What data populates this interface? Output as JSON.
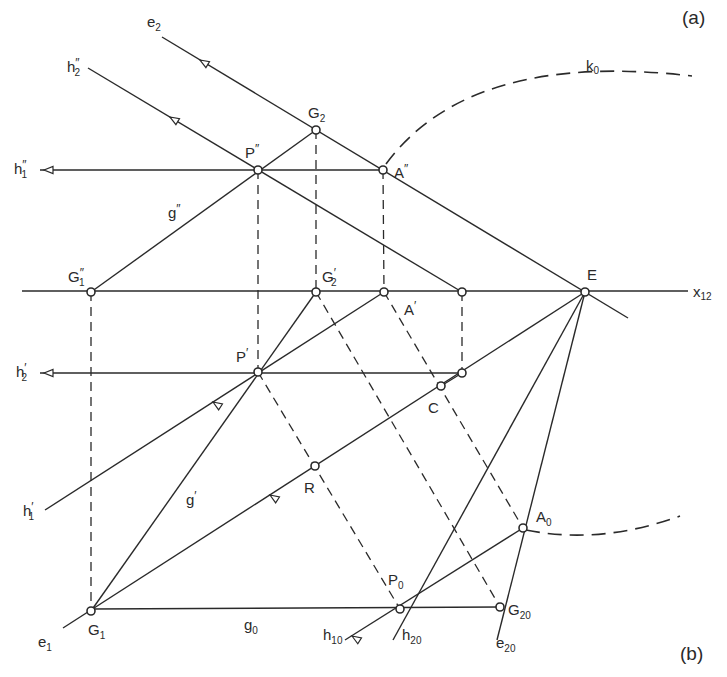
{
  "figure": {
    "panel_labels": {
      "a": "(a)",
      "b": "(b)"
    },
    "axis_label": {
      "base": "x",
      "sub": "12"
    },
    "curve_label": {
      "base": "k",
      "sub": "0"
    }
  },
  "points": [
    {
      "id": "G2",
      "base": "G",
      "sub": "2",
      "prime": "",
      "x": 316,
      "y": 130,
      "lx": 308,
      "ly": 118
    },
    {
      "id": "P''",
      "base": "P",
      "sub": "",
      "prime": "″",
      "x": 258,
      "y": 170,
      "lx": 245,
      "ly": 158
    },
    {
      "id": "A''",
      "base": "A",
      "sub": "",
      "prime": "″",
      "x": 383,
      "y": 170,
      "lx": 394,
      "ly": 178
    },
    {
      "id": "G1''",
      "base": "G",
      "sub": "1",
      "prime": "″",
      "x": 91,
      "y": 292,
      "lx": 68,
      "ly": 282
    },
    {
      "id": "G2'",
      "base": "G",
      "sub": "2",
      "prime": "′",
      "x": 316,
      "y": 292,
      "lx": 322,
      "ly": 282
    },
    {
      "id": "A'",
      "base": "A",
      "sub": "",
      "prime": "′",
      "x": 384,
      "y": 292,
      "lx": 404,
      "ly": 315
    },
    {
      "id": "Q",
      "base": "",
      "sub": "",
      "prime": "",
      "x": 462,
      "y": 292,
      "lx": 0,
      "ly": 0
    },
    {
      "id": "E",
      "base": "E",
      "sub": "",
      "prime": "",
      "x": 585,
      "y": 292,
      "lx": 587,
      "ly": 280
    },
    {
      "id": "P'",
      "base": "P",
      "sub": "",
      "prime": "′",
      "x": 258,
      "y": 372,
      "lx": 236,
      "ly": 362
    },
    {
      "id": "S",
      "base": "",
      "sub": "",
      "prime": "",
      "x": 462,
      "y": 373,
      "lx": 0,
      "ly": 0
    },
    {
      "id": "C",
      "base": "C",
      "sub": "",
      "prime": "",
      "x": 441,
      "y": 386,
      "lx": 428,
      "ly": 413
    },
    {
      "id": "R",
      "base": "R",
      "sub": "",
      "prime": "",
      "x": 315,
      "y": 466,
      "lx": 304,
      "ly": 493
    },
    {
      "id": "A0",
      "base": "A",
      "sub": "0",
      "prime": "",
      "x": 523,
      "y": 528,
      "lx": 536,
      "ly": 522
    },
    {
      "id": "P0",
      "base": "P",
      "sub": "0",
      "prime": "",
      "x": 400,
      "y": 609,
      "lx": 388,
      "ly": 585
    },
    {
      "id": "G20",
      "base": "G",
      "sub": "20",
      "prime": "",
      "x": 500,
      "y": 607,
      "lx": 508,
      "ly": 615
    },
    {
      "id": "G1",
      "base": "G",
      "sub": "1",
      "prime": "",
      "x": 91,
      "y": 611,
      "lx": 88,
      "ly": 635
    }
  ],
  "line_labels": [
    {
      "id": "e2",
      "base": "e",
      "sub": "2",
      "prime": "",
      "lx": 147,
      "ly": 27
    },
    {
      "id": "h2''",
      "base": "h",
      "sub": "2",
      "prime": "″",
      "lx": 67,
      "ly": 72
    },
    {
      "id": "h1''",
      "base": "h",
      "sub": "1",
      "prime": "″",
      "lx": 14,
      "ly": 174
    },
    {
      "id": "g''",
      "base": "g",
      "sub": "",
      "prime": "″",
      "lx": 168,
      "ly": 218
    },
    {
      "id": "h2'",
      "base": "h",
      "sub": "2",
      "prime": "′",
      "lx": 16,
      "ly": 377
    },
    {
      "id": "h1'",
      "base": "h",
      "sub": "1",
      "prime": "′",
      "lx": 23,
      "ly": 516
    },
    {
      "id": "g'",
      "base": "g",
      "sub": "",
      "prime": "′",
      "lx": 186,
      "ly": 505
    },
    {
      "id": "e1",
      "base": "e",
      "sub": "1",
      "prime": "",
      "lx": 38,
      "ly": 647
    },
    {
      "id": "g0",
      "base": "g",
      "sub": "0",
      "prime": "",
      "lx": 244,
      "ly": 630
    },
    {
      "id": "h10",
      "base": "h",
      "sub": "10",
      "prime": "",
      "lx": 323,
      "ly": 640
    },
    {
      "id": "h20",
      "base": "h",
      "sub": "20",
      "prime": "",
      "lx": 402,
      "ly": 640
    },
    {
      "id": "e20",
      "base": "e",
      "sub": "20",
      "prime": "",
      "lx": 496,
      "ly": 648
    }
  ],
  "solid_lines": [
    {
      "name": "x12-axis",
      "x1": 22,
      "y1": 291,
      "x2": 688,
      "y2": 291
    },
    {
      "name": "e2-line",
      "x1": 162,
      "y1": 37,
      "x2": 628,
      "y2": 318
    },
    {
      "name": "h2pp-line",
      "x1": 88,
      "y1": 68,
      "x2": 462,
      "y2": 292
    },
    {
      "name": "h1pp-line",
      "x1": 40,
      "y1": 170,
      "x2": 383,
      "y2": 170
    },
    {
      "name": "gpp-line",
      "x1": 91,
      "y1": 292,
      "x2": 316,
      "y2": 130
    },
    {
      "name": "h2p-line",
      "x1": 40,
      "y1": 373,
      "x2": 462,
      "y2": 373
    },
    {
      "name": "h1p-line",
      "x1": 45,
      "y1": 510,
      "x2": 384,
      "y2": 292
    },
    {
      "name": "e1-line",
      "x1": 63,
      "y1": 628,
      "x2": 585,
      "y2": 292
    },
    {
      "name": "gp-line",
      "x1": 91,
      "y1": 611,
      "x2": 316,
      "y2": 292
    },
    {
      "name": "g0-line",
      "x1": 91,
      "y1": 609,
      "x2": 500,
      "y2": 607
    },
    {
      "name": "h20-line",
      "x1": 393,
      "y1": 640,
      "x2": 585,
      "y2": 292
    },
    {
      "name": "e20-line",
      "x1": 497,
      "y1": 640,
      "x2": 585,
      "y2": 292
    },
    {
      "name": "h10-line",
      "x1": 345,
      "y1": 640,
      "x2": 523,
      "y2": 528
    },
    {
      "name": "p-to-c-seg",
      "x1": 441,
      "y1": 386,
      "x2": 462,
      "y2": 373
    }
  ],
  "dashed_lines": [
    {
      "name": "g1-ordinal",
      "x1": 91,
      "y1": 292,
      "x2": 91,
      "y2": 611
    },
    {
      "name": "p-ordinal",
      "x1": 258,
      "y1": 170,
      "x2": 258,
      "y2": 372
    },
    {
      "name": "g2-ordinal",
      "x1": 316,
      "y1": 130,
      "x2": 316,
      "y2": 292
    },
    {
      "name": "a-ordinal",
      "x1": 383,
      "y1": 170,
      "x2": 384,
      "y2": 292
    },
    {
      "name": "q-ordinal",
      "x1": 462,
      "y1": 292,
      "x2": 462,
      "y2": 373
    },
    {
      "name": "p-to-p0",
      "x1": 258,
      "y1": 372,
      "x2": 400,
      "y2": 609
    },
    {
      "name": "g2-to-g20",
      "x1": 316,
      "y1": 292,
      "x2": 500,
      "y2": 607
    },
    {
      "name": "a-to-a0",
      "x1": 384,
      "y1": 292,
      "x2": 523,
      "y2": 528
    }
  ],
  "arcs": [
    {
      "name": "k0-upper-arc",
      "d": "M 386 164 Q 470 50 692 76"
    },
    {
      "name": "k0-lower-arc",
      "d": "M 526 530 Q 600 545 680 516"
    }
  ],
  "arrows": [
    {
      "name": "h1pp-arrow",
      "x": 44,
      "y": 170,
      "angle": 180
    },
    {
      "name": "h2p-arrow",
      "x": 44,
      "y": 373,
      "angle": 180
    },
    {
      "name": "e2-arrow",
      "x": 200,
      "y": 60,
      "angle": 211
    },
    {
      "name": "h2pp-arrow",
      "x": 170,
      "y": 117,
      "angle": 211
    },
    {
      "name": "h1p-arrow",
      "x": 213,
      "y": 402,
      "angle": 213
    },
    {
      "name": "e1-arrow",
      "x": 270,
      "y": 495,
      "angle": 213
    },
    {
      "name": "h10-arrow",
      "x": 352,
      "y": 636,
      "angle": 212
    }
  ]
}
